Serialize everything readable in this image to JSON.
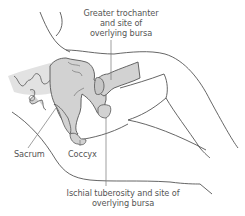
{
  "diagram": {
    "labels": {
      "greater_trochanter": [
        "Greater trochanter",
        "and site of",
        "overlying bursa"
      ],
      "sacrum": "Sacrum",
      "coccyx": "Coccyx",
      "ischial_tuberosity": [
        "Ischial tuberosity and site of",
        "overlying bursa"
      ]
    },
    "colors": {
      "background": "#ffffff",
      "outline": "#555555",
      "bone_fill": "#d2d2d2",
      "bone_fill_light": "#e2e2e2",
      "leader_line": "#777777",
      "label_text": "#555555"
    }
  }
}
